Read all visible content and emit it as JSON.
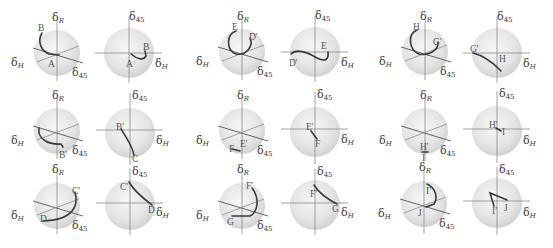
{
  "figure": {
    "axis_labels": {
      "r": {
        "base": "δ",
        "sub": "R"
      },
      "h": {
        "base": "δ",
        "sub": "H"
      },
      "d45": {
        "base": "δ",
        "sub": "45"
      }
    },
    "colors": {
      "sphere_fill": "#e6e6e6",
      "sphere_edge": "#d0d0d0",
      "axis": "#8a8a8a",
      "trajectory": "#3a3a3a",
      "label": "#3a3a3a"
    },
    "panels": [
      {
        "row": 0,
        "col": 0,
        "sphere3d": {
          "start": "A",
          "end": "B"
        },
        "proj2d": {
          "start": "A",
          "end": "B"
        }
      },
      {
        "row": 0,
        "col": 1,
        "sphere3d": {
          "start": "D'",
          "end": "E"
        },
        "proj2d": {
          "start": "D'",
          "end": "E"
        }
      },
      {
        "row": 0,
        "col": 2,
        "sphere3d": {
          "start": "G'",
          "end": "H"
        },
        "proj2d": {
          "start": "G'",
          "end": "H"
        }
      },
      {
        "row": 1,
        "col": 0,
        "sphere3d": {
          "start": "B'",
          "end": "C"
        },
        "proj2d": {
          "start": "B'",
          "end": "C"
        }
      },
      {
        "row": 1,
        "col": 1,
        "sphere3d": {
          "start": "E'",
          "end": "F"
        },
        "proj2d": {
          "start": "E'",
          "end": "F"
        }
      },
      {
        "row": 1,
        "col": 2,
        "sphere3d": {
          "start": "H'",
          "end": "I"
        },
        "proj2d": {
          "start": "H'",
          "end": "I"
        }
      },
      {
        "row": 2,
        "col": 0,
        "sphere3d": {
          "start": "C'",
          "end": "D"
        },
        "proj2d": {
          "start": "C'",
          "end": "D"
        }
      },
      {
        "row": 2,
        "col": 1,
        "sphere3d": {
          "start": "F'",
          "end": "G"
        },
        "proj2d": {
          "start": "F'",
          "end": "G"
        }
      },
      {
        "row": 2,
        "col": 2,
        "sphere3d": {
          "start": "I'",
          "end": "J"
        },
        "proj2d": {
          "start": "I'",
          "end": "J"
        }
      }
    ]
  }
}
